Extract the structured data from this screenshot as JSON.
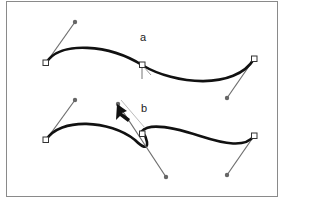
{
  "figure": {
    "labels": {
      "a": "a",
      "b": "b"
    },
    "colors": {
      "path": "#111111",
      "handle_line": "#6e6e6e",
      "ghost_handle": "#b8b8b8",
      "anchor_fill": "#ffffff",
      "anchor_stroke": "#333333",
      "handle_dot": "#666666",
      "frame": "#8a8a8a"
    },
    "panel_a": {
      "description": "Smooth curve with symmetric handles at middle anchor",
      "anchors": [
        {
          "x": 46,
          "y": 63
        },
        {
          "x": 142,
          "y": 65
        },
        {
          "x": 254,
          "y": 59
        }
      ],
      "handles": [
        {
          "from": [
            46,
            63
          ],
          "to": [
            75,
            22
          ]
        },
        {
          "from": [
            254,
            59
          ],
          "to": [
            227,
            98
          ]
        }
      ]
    },
    "panel_b": {
      "description": "Dragging a direction handle with the convert-point tool to create a corner point",
      "anchors": [
        {
          "x": 46,
          "y": 140
        },
        {
          "x": 142,
          "y": 134
        },
        {
          "x": 254,
          "y": 136
        }
      ],
      "handles": [
        {
          "from": [
            46,
            140
          ],
          "to": [
            75,
            100
          ]
        },
        {
          "from": [
            254,
            136
          ],
          "to": [
            227,
            175
          ]
        },
        {
          "from": [
            142,
            134
          ],
          "to": [
            166,
            177
          ]
        },
        {
          "from": [
            142,
            134
          ],
          "to": [
            118,
            104
          ]
        }
      ],
      "cursor": {
        "x": 117,
        "y": 104,
        "icon": "arrow-cursor-icon"
      }
    }
  }
}
